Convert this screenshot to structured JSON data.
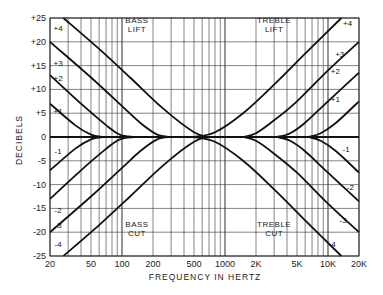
{
  "chart_data": {
    "type": "line",
    "title": "",
    "xlabel": "FREQUENCY IN HERTZ",
    "ylabel": "DECIBELS",
    "xscale": "log",
    "xlim": [
      20,
      20000
    ],
    "ylim": [
      -25,
      25
    ],
    "grid": true,
    "x_tick_labels": [
      "20",
      "50",
      "100",
      "200",
      "500",
      "1000",
      "2K",
      "5K",
      "10K",
      "20K"
    ],
    "x_tick_values": [
      20,
      50,
      100,
      200,
      500,
      1000,
      2000,
      5000,
      10000,
      20000
    ],
    "y_tick_labels": [
      "+25",
      "+20",
      "+15",
      "+10",
      "+5",
      "0",
      "-5",
      "-10",
      "-15",
      "-20",
      "-25"
    ],
    "y_tick_values": [
      25,
      20,
      15,
      10,
      5,
      0,
      -5,
      -10,
      -15,
      -20,
      -25
    ],
    "annotations": [
      {
        "text": "BASS",
        "line2": "LIFT",
        "x": 140,
        "y": 24
      },
      {
        "text": "TREBLE",
        "line2": "LIFT",
        "x": 3000,
        "y": 24
      },
      {
        "text": "BASS",
        "line2": "CUT",
        "x": 140,
        "y": -19
      },
      {
        "text": "TREBLE",
        "line2": "CUT",
        "x": 3000,
        "y": -19
      }
    ],
    "series": [
      {
        "name": "Bass +4",
        "label": "+4",
        "x": [
          27,
          60,
          120,
          250,
          500,
          700
        ],
        "y": [
          25,
          18.5,
          12.5,
          6,
          1,
          0
        ]
      },
      {
        "name": "Bass +3",
        "label": "+3",
        "x": [
          20,
          50,
          100,
          150,
          220,
          300
        ],
        "y": [
          20,
          12.5,
          6.5,
          3,
          0.5,
          0
        ]
      },
      {
        "name": "Bass +2",
        "label": "+2",
        "x": [
          20,
          40,
          70,
          95,
          130
        ],
        "y": [
          13,
          7,
          2.5,
          0.5,
          0
        ]
      },
      {
        "name": "Bass +1",
        "label": "+1",
        "x": [
          20,
          35,
          50,
          65
        ],
        "y": [
          7,
          2.5,
          0.5,
          0
        ]
      },
      {
        "name": "Bass -1",
        "label": "-1",
        "x": [
          20,
          35,
          50,
          65
        ],
        "y": [
          -7,
          -2.5,
          -0.5,
          0
        ]
      },
      {
        "name": "Bass -2",
        "label": "-2",
        "x": [
          20,
          40,
          70,
          95,
          130
        ],
        "y": [
          -13,
          -7,
          -2.5,
          -0.5,
          0
        ]
      },
      {
        "name": "Bass -3",
        "label": "-3",
        "x": [
          20,
          50,
          100,
          150,
          220,
          300
        ],
        "y": [
          -20,
          -12.5,
          -6.5,
          -3,
          -0.5,
          0
        ]
      },
      {
        "name": "Bass -4",
        "label": "-4",
        "x": [
          27,
          60,
          120,
          250,
          500,
          700
        ],
        "y": [
          -25,
          -18.5,
          -12.5,
          -6,
          -1,
          0
        ]
      },
      {
        "name": "Treble +4",
        "label": "+4",
        "x": [
          500,
          800,
          1500,
          3000,
          6000,
          13500
        ],
        "y": [
          0,
          1,
          5,
          11,
          17.5,
          25
        ]
      },
      {
        "name": "Treble +3",
        "label": "+3",
        "x": [
          1500,
          2000,
          3000,
          5000,
          10000,
          20000
        ],
        "y": [
          0,
          0.8,
          3.5,
          7.5,
          14,
          20
        ]
      },
      {
        "name": "Treble +2",
        "label": "+2",
        "x": [
          3200,
          4300,
          6000,
          10000,
          20000
        ],
        "y": [
          0,
          0.8,
          3,
          7.5,
          13.5
        ]
      },
      {
        "name": "Treble +1",
        "label": "+1",
        "x": [
          6500,
          8500,
          12000,
          20000
        ],
        "y": [
          0,
          0.8,
          3,
          7.5
        ]
      },
      {
        "name": "Treble -1",
        "label": "-1",
        "x": [
          6500,
          8500,
          12000,
          20000
        ],
        "y": [
          0,
          -0.8,
          -3,
          -7.5
        ]
      },
      {
        "name": "Treble -2",
        "label": "-2",
        "x": [
          3200,
          4300,
          6000,
          10000,
          20000
        ],
        "y": [
          0,
          -0.8,
          -3,
          -7.5,
          -13.5
        ]
      },
      {
        "name": "Treble -3",
        "label": "-3",
        "x": [
          1500,
          2000,
          3000,
          5000,
          10000,
          20000
        ],
        "y": [
          0,
          -0.8,
          -3.5,
          -7.5,
          -14,
          -20
        ]
      },
      {
        "name": "Treble -4",
        "label": "-4",
        "x": [
          500,
          800,
          1500,
          3000,
          6000,
          13500
        ],
        "y": [
          0,
          -1,
          -5,
          -11,
          -17.5,
          -25
        ]
      },
      {
        "name": "Flat",
        "label": "",
        "x": [
          20,
          20000
        ],
        "y": [
          0,
          0
        ]
      }
    ],
    "curve_labels": [
      {
        "text": "+4",
        "x": 24,
        "y": 23
      },
      {
        "text": "+3",
        "x": 24,
        "y": 15.5
      },
      {
        "text": "+2",
        "x": 24,
        "y": 12.5
      },
      {
        "text": "+1",
        "x": 24,
        "y": 5.5
      },
      {
        "text": "-1",
        "x": 24,
        "y": -3
      },
      {
        "text": "-2",
        "x": 24,
        "y": -15.3
      },
      {
        "text": "-3",
        "x": 24,
        "y": -18.5
      },
      {
        "text": "-4",
        "x": 24,
        "y": -22.5
      },
      {
        "text": "+4",
        "x": 15500,
        "y": 24
      },
      {
        "text": "+3",
        "x": 13000,
        "y": 17.5
      },
      {
        "text": "+2",
        "x": 11800,
        "y": 13.8
      },
      {
        "text": "+1",
        "x": 11800,
        "y": 8
      },
      {
        "text": "-1",
        "x": 15000,
        "y": -2.5
      },
      {
        "text": "-2",
        "x": 16500,
        "y": -10.5
      },
      {
        "text": "-3",
        "x": 14000,
        "y": -17.5
      },
      {
        "text": "-4",
        "x": 11000,
        "y": -22.5
      }
    ]
  },
  "colors": {
    "line": "#111111",
    "grid": "#333333",
    "text": "#222222",
    "background": "#ffffff"
  }
}
